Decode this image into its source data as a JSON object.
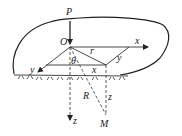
{
  "diagram": {
    "type": "mechanics-schematic",
    "labels": {
      "load": "P",
      "origin": "O",
      "x_axis": "x",
      "y_axis": "y",
      "z_axis": "z",
      "radius_horizontal": "r",
      "angle": "θ",
      "radius_spatial": "R",
      "point": "M",
      "x_component": "x",
      "y_component": "y",
      "z_component": "z"
    },
    "colors": {
      "stroke": "#333333",
      "background": "#ffffff"
    }
  }
}
